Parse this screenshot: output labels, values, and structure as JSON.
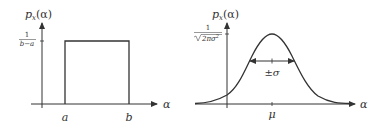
{
  "figure": {
    "panels": [
      {
        "name": "uniform",
        "y_label": "p_x(α)",
        "y_label_main": "p",
        "y_label_sub": "x",
        "y_label_arg": "(α)",
        "y_tick_numerator": "1",
        "y_tick_denominator": "b−a",
        "x_label": "α",
        "x_ticks": [
          "a",
          "b"
        ]
      },
      {
        "name": "gaussian",
        "y_label_main": "p",
        "y_label_sub": "x",
        "y_label_arg": "(α)",
        "y_tick_numerator": "1",
        "y_tick_denominator": "√2πσ²",
        "y_tick_denominator_text": "2πσ",
        "y_tick_denominator_exp": "2",
        "x_label": "α",
        "x_ticks": [
          "μ"
        ],
        "width_annotation": "±σ"
      }
    ],
    "colors": {
      "stroke": "#333333",
      "background": "#ffffff"
    }
  }
}
